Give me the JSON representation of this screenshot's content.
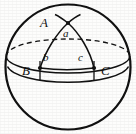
{
  "figure": {
    "background_color": "#fdfdfc",
    "stroke_color": "#111111",
    "labels": {
      "vertex_A": "A",
      "vertex_B": "B",
      "vertex_C": "C",
      "angle_a": "a",
      "angle_b": "b",
      "angle_c": "c"
    },
    "geometry": {
      "sphere": {
        "cx": 68,
        "cy": 67,
        "r": 63
      },
      "equator_ellipse": {
        "cx": 68,
        "cy": 56,
        "rx": 62,
        "ry": 17
      },
      "lower_latitude_ellipse": {
        "cx": 68,
        "cy": 68,
        "rx": 62,
        "ry": 17
      },
      "vertex_points": [
        {
          "name": "A",
          "x": 68,
          "y": 23
        },
        {
          "name": "B",
          "x": 40,
          "y": 68
        },
        {
          "name": "C",
          "x": 94,
          "y": 68
        }
      ],
      "label_positions": [
        {
          "text": "A",
          "x": 44,
          "y": 22
        },
        {
          "text": "a",
          "x": 65,
          "y": 31
        },
        {
          "text": "b",
          "x": 45,
          "y": 58
        },
        {
          "text": "c",
          "x": 80,
          "y": 58
        },
        {
          "text": "B",
          "x": 26,
          "y": 67
        },
        {
          "text": "C",
          "x": 103,
          "y": 67
        }
      ],
      "equator_back_half": "dashed",
      "equator_front_half": "solid"
    }
  }
}
